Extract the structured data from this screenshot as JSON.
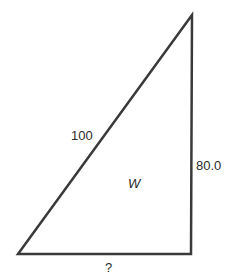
{
  "diagram": {
    "type": "right-triangle",
    "stroke_color": "#3a3a3a",
    "vertices": {
      "top_right": [
        192,
        15
      ],
      "bottom_left": [
        18,
        254
      ],
      "bottom_right": [
        191,
        254
      ]
    },
    "labels": {
      "hypotenuse": "100",
      "vertical_side": "80.0",
      "horizontal_side": "?",
      "interior": "W"
    }
  }
}
